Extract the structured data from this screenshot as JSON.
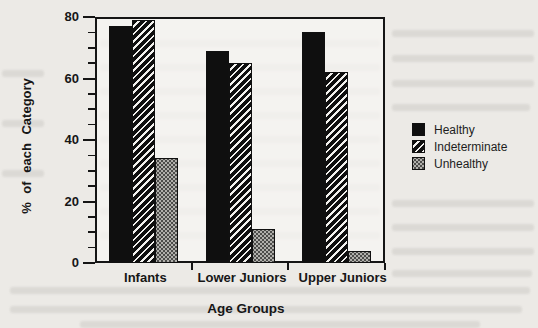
{
  "page": {
    "background_color": "#eceae6",
    "ink_color": "#151515"
  },
  "chart_data": {
    "type": "bar",
    "title": "",
    "xlabel": "Age Groups",
    "ylabel": "% of each Category",
    "categories": [
      "Infants",
      "Lower Juniors",
      "Upper Juniors"
    ],
    "series": [
      {
        "name": "Healthy",
        "pattern": "solid-black",
        "values": [
          77,
          69,
          75
        ]
      },
      {
        "name": "Indeterminate",
        "pattern": "diagonal-hatch",
        "values": [
          79,
          65,
          62
        ]
      },
      {
        "name": "Unhealthy",
        "pattern": "gray-dotted",
        "values": [
          34,
          11,
          4
        ]
      }
    ],
    "ylim": [
      0,
      80
    ],
    "yticks": [
      0,
      20,
      40,
      60,
      80
    ],
    "minor_tick_step": 5,
    "grid": false,
    "legend_position": "right-outside"
  },
  "legend": {
    "items": [
      {
        "label": "Healthy"
      },
      {
        "label": "Indeterminate"
      },
      {
        "label": "Unhealthy"
      }
    ]
  }
}
